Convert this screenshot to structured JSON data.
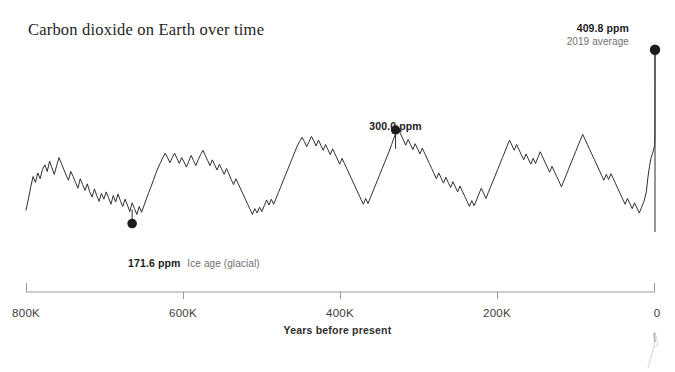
{
  "title": "Carbon dioxide on Earth over time",
  "colors": {
    "line": "#2f2f2f",
    "axis": "#8c8c8c",
    "text": "#2b2b2b",
    "muted": "#6f6f6f",
    "background": "#ffffff"
  },
  "annotations": {
    "modern": {
      "value": "409.8 ppm",
      "sub": "2019 average"
    },
    "peak300": {
      "value": "300.0 ppm",
      "sub": ""
    },
    "glacial": {
      "value": "171.6 ppm",
      "sub": "Ice age (glacial)"
    }
  },
  "axis": {
    "title": "Years before present",
    "ticks": [
      "800K",
      "600K",
      "400K",
      "200K",
      "0"
    ]
  },
  "chart_data": {
    "type": "line",
    "title": "Carbon dioxide on Earth over time",
    "xlabel": "Years before present",
    "ylabel": "CO2 concentration (ppm)",
    "xlim": [
      800000,
      0
    ],
    "ylim": [
      160,
      415
    ],
    "x_reversed": true,
    "grid": false,
    "legend": null,
    "tick_labels": [
      "800K",
      "600K",
      "400K",
      "200K",
      "0"
    ],
    "tick_values": [
      800000,
      600000,
      400000,
      200000,
      0
    ],
    "annotations": [
      {
        "label": "409.8 ppm",
        "sublabel": "2019 average",
        "x": 0,
        "y": 409.8
      },
      {
        "label": "300.0 ppm",
        "sublabel": "",
        "x": 330000,
        "y": 300.0
      },
      {
        "label": "171.6 ppm",
        "sublabel": "Ice age (glacial)",
        "x": 665000,
        "y": 171.6
      }
    ],
    "series": [
      {
        "name": "Atmospheric CO2 (ice core record)",
        "units": "ppm",
        "x": [
          800000,
          797000,
          794000,
          791000,
          788000,
          785000,
          782000,
          779000,
          776000,
          773000,
          770000,
          767000,
          764000,
          761000,
          758000,
          755000,
          752000,
          749000,
          746000,
          743000,
          740000,
          737000,
          734000,
          731000,
          728000,
          725000,
          722000,
          719000,
          716000,
          713000,
          710000,
          707000,
          704000,
          701000,
          698000,
          695000,
          692000,
          689000,
          686000,
          683000,
          680000,
          677000,
          674000,
          671000,
          668000,
          665000,
          662000,
          659000,
          656000,
          653000,
          650000,
          647000,
          644000,
          641000,
          638000,
          635000,
          632000,
          629000,
          626000,
          623000,
          620000,
          617000,
          614000,
          611000,
          608000,
          605000,
          602000,
          599000,
          596000,
          593000,
          590000,
          587000,
          584000,
          581000,
          578000,
          575000,
          572000,
          569000,
          566000,
          563000,
          560000,
          557000,
          554000,
          551000,
          548000,
          545000,
          542000,
          539000,
          536000,
          533000,
          530000,
          527000,
          524000,
          521000,
          518000,
          515000,
          512000,
          509000,
          506000,
          503000,
          500000,
          497000,
          494000,
          491000,
          488000,
          485000,
          482000,
          479000,
          476000,
          473000,
          470000,
          467000,
          464000,
          461000,
          458000,
          455000,
          452000,
          449000,
          446000,
          443000,
          440000,
          437000,
          434000,
          431000,
          428000,
          425000,
          422000,
          419000,
          416000,
          413000,
          410000,
          407000,
          404000,
          401000,
          398000,
          395000,
          392000,
          389000,
          386000,
          383000,
          380000,
          377000,
          374000,
          371000,
          368000,
          365000,
          362000,
          359000,
          356000,
          353000,
          350000,
          347000,
          344000,
          341000,
          338000,
          335000,
          332000,
          329000,
          326000,
          323000,
          320000,
          317000,
          314000,
          311000,
          308000,
          305000,
          302000,
          299000,
          296000,
          293000,
          290000,
          287000,
          284000,
          281000,
          278000,
          275000,
          272000,
          269000,
          266000,
          263000,
          260000,
          257000,
          254000,
          251000,
          248000,
          245000,
          242000,
          239000,
          236000,
          233000,
          230000,
          227000,
          224000,
          221000,
          218000,
          215000,
          212000,
          209000,
          206000,
          203000,
          200000,
          197000,
          194000,
          191000,
          188000,
          185000,
          182000,
          179000,
          176000,
          173000,
          170000,
          167000,
          164000,
          161000,
          158000,
          155000,
          152000,
          149000,
          146000,
          143000,
          140000,
          137000,
          134000,
          131000,
          128000,
          125000,
          122000,
          119000,
          116000,
          113000,
          110000,
          107000,
          104000,
          101000,
          98000,
          95000,
          92000,
          89000,
          86000,
          83000,
          80000,
          77000,
          74000,
          71000,
          68000,
          65000,
          62000,
          59000,
          56000,
          53000,
          50000,
          47000,
          44000,
          41000,
          38000,
          35000,
          32000,
          29000,
          26000,
          23000,
          20000,
          17000,
          14000,
          11000,
          9000,
          7000,
          5000,
          3000,
          2000,
          1000,
          500,
          200,
          100,
          60,
          30,
          0
        ],
        "y": [
          190,
          205,
          222,
          236,
          228,
          241,
          233,
          246,
          252,
          243,
          257,
          248,
          239,
          251,
          262,
          254,
          246,
          238,
          231,
          243,
          236,
          228,
          220,
          233,
          225,
          217,
          226,
          215,
          208,
          219,
          210,
          202,
          213,
          205,
          215,
          207,
          198,
          210,
          201,
          212,
          203,
          195,
          205,
          197,
          188,
          200,
          192,
          184,
          195,
          187,
          196,
          205,
          214,
          222,
          231,
          240,
          248,
          255,
          262,
          268,
          262,
          255,
          262,
          268,
          261,
          254,
          262,
          256,
          249,
          257,
          265,
          258,
          251,
          259,
          266,
          272,
          265,
          258,
          251,
          259,
          252,
          245,
          253,
          246,
          239,
          247,
          240,
          232,
          225,
          233,
          226,
          219,
          212,
          205,
          198,
          191,
          184,
          192,
          186,
          194,
          188,
          196,
          204,
          197,
          205,
          198,
          206,
          214,
          222,
          230,
          238,
          246,
          254,
          262,
          270,
          278,
          284,
          290,
          284,
          277,
          284,
          291,
          285,
          278,
          286,
          279,
          272,
          280,
          273,
          266,
          274,
          267,
          260,
          253,
          261,
          254,
          247,
          240,
          233,
          226,
          219,
          212,
          205,
          198,
          206,
          199,
          207,
          215,
          223,
          231,
          239,
          247,
          255,
          263,
          271,
          280,
          289,
          297,
          300,
          293,
          286,
          279,
          287,
          280,
          273,
          281,
          274,
          267,
          275,
          268,
          261,
          254,
          247,
          240,
          233,
          241,
          234,
          227,
          235,
          228,
          221,
          229,
          222,
          215,
          223,
          216,
          209,
          202,
          195,
          203,
          196,
          204,
          212,
          220,
          213,
          206,
          214,
          222,
          230,
          238,
          246,
          254,
          262,
          270,
          278,
          286,
          279,
          272,
          280,
          273,
          266,
          259,
          267,
          260,
          253,
          261,
          254,
          262,
          270,
          263,
          256,
          249,
          242,
          250,
          243,
          236,
          229,
          222,
          230,
          238,
          246,
          254,
          262,
          270,
          278,
          286,
          294,
          287,
          280,
          273,
          266,
          259,
          252,
          245,
          238,
          231,
          239,
          232,
          240,
          233,
          226,
          219,
          212,
          205,
          198,
          206,
          199,
          192,
          200,
          193,
          186,
          194,
          202,
          215,
          235,
          250,
          262,
          268,
          272,
          276,
          280,
          290,
          300,
          320,
          360,
          409.8
        ]
      }
    ]
  }
}
